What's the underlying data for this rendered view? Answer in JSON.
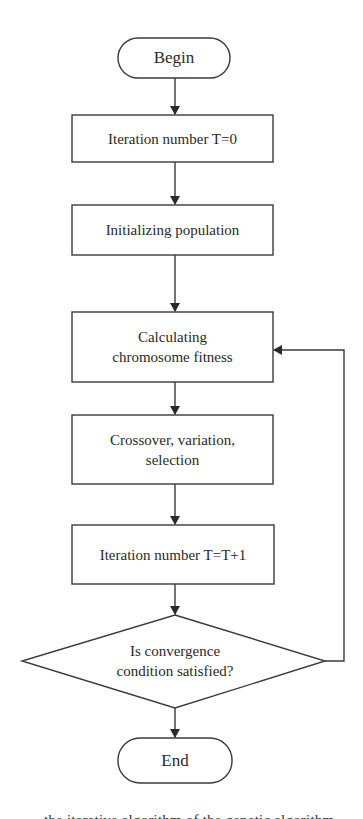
{
  "flowchart": {
    "start": {
      "label": "Begin"
    },
    "steps": [
      {
        "label": "Iteration number T=0"
      },
      {
        "label": "Initializing population"
      },
      {
        "label": "Calculating chromosome fitness",
        "line1": "Calculating",
        "line2": "chromosome fitness"
      },
      {
        "label": "Crossover, variation, selection",
        "line1": "Crossover, variation,",
        "line2": "selection"
      },
      {
        "label": "Iteration number T=T+1"
      }
    ],
    "decision": {
      "label": "Is convergence condition satisfied?",
      "line1": "Is convergence",
      "line2": "condition satisfied?",
      "no_branch_target": "Calculating chromosome fitness",
      "yes_branch_target": "End"
    },
    "end": {
      "label": "End"
    },
    "colors": {
      "stroke": "#3a3a3a",
      "fill": "#ffffff",
      "text": "#2a2a2a"
    }
  },
  "caption": {
    "visible_fragment": "the iterative algorithm of the genetic algorithm"
  }
}
